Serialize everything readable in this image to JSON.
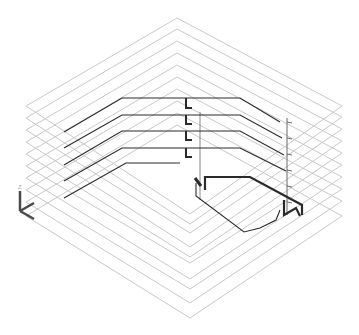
{
  "view": {
    "type": "isometric-3d-model",
    "background": "#ffffff",
    "plate_color": "#c8c8c8",
    "pipe_color": "#2a2a2a",
    "pipe_light_color": "#6a6a6a",
    "axis_color": "#4a4a4a"
  },
  "floor_plates": [
    {
      "top": [
        177,
        18
      ],
      "right": [
        342,
        106
      ],
      "bottom": [
        190,
        214
      ],
      "left": [
        26,
        106
      ]
    },
    {
      "top": [
        177,
        29
      ],
      "right": [
        342,
        117
      ],
      "bottom": [
        190,
        224
      ],
      "left": [
        26,
        118
      ]
    },
    {
      "top": [
        177,
        41
      ],
      "right": [
        342,
        129
      ],
      "bottom": [
        190,
        233
      ],
      "left": [
        26,
        130
      ]
    },
    {
      "top": [
        177,
        53
      ],
      "right": [
        342,
        141
      ],
      "bottom": [
        190,
        247
      ],
      "left": [
        26,
        142
      ]
    },
    {
      "top": [
        177,
        65
      ],
      "right": [
        342,
        153
      ],
      "bottom": [
        190,
        257
      ],
      "left": [
        26,
        154
      ]
    },
    {
      "top": [
        177,
        77
      ],
      "right": [
        342,
        165
      ],
      "bottom": [
        190,
        263
      ],
      "left": [
        26,
        166
      ]
    },
    {
      "top": [
        177,
        89
      ],
      "right": [
        342,
        177
      ],
      "bottom": [
        190,
        279
      ],
      "left": [
        26,
        178
      ]
    },
    {
      "top": [
        177,
        101
      ],
      "right": [
        342,
        189
      ],
      "bottom": [
        190,
        289
      ],
      "left": [
        26,
        190
      ]
    },
    {
      "top": [
        177,
        113
      ],
      "right": [
        342,
        201
      ],
      "bottom": [
        190,
        303
      ],
      "left": [
        26,
        202
      ]
    },
    {
      "top": [
        177,
        125
      ],
      "right": [
        342,
        216
      ],
      "bottom": [
        190,
        318
      ],
      "left": [
        26,
        216
      ]
    }
  ],
  "pipe_runs": [
    {
      "points": [
        [
          64,
          132
        ],
        [
          122,
          98
        ],
        [
          180,
          98
        ],
        [
          240,
          98
        ],
        [
          280,
          122
        ]
      ]
    },
    {
      "points": [
        [
          64,
          148
        ],
        [
          122,
          115
        ],
        [
          180,
          115
        ],
        [
          240,
          115
        ],
        [
          282,
          138
        ]
      ]
    },
    {
      "points": [
        [
          64,
          165
        ],
        [
          122,
          131
        ],
        [
          180,
          131
        ],
        [
          240,
          131
        ],
        [
          284,
          155
        ]
      ]
    },
    {
      "points": [
        [
          64,
          181
        ],
        [
          122,
          148
        ],
        [
          180,
          148
        ],
        [
          240,
          148
        ],
        [
          286,
          171
        ]
      ]
    },
    {
      "points": [
        [
          64,
          198
        ],
        [
          126,
          163
        ],
        [
          180,
          163
        ]
      ]
    }
  ],
  "risers": [
    {
      "points": [
        [
          186,
          98
        ],
        [
          186,
          108
        ],
        [
          192,
          108
        ]
      ]
    },
    {
      "points": [
        [
          186,
          115
        ],
        [
          186,
          124
        ],
        [
          192,
          124
        ]
      ]
    },
    {
      "points": [
        [
          186,
          131
        ],
        [
          186,
          140
        ],
        [
          192,
          140
        ]
      ]
    },
    {
      "points": [
        [
          186,
          148
        ],
        [
          186,
          157
        ],
        [
          192,
          157
        ]
      ]
    }
  ],
  "main_branch": {
    "points": [
      [
        205,
        190
      ],
      [
        205,
        177
      ],
      [
        250,
        177
      ],
      [
        302,
        205
      ],
      [
        302,
        215
      ]
    ]
  },
  "lower_branch": {
    "points": [
      [
        196,
        183
      ],
      [
        196,
        196
      ],
      [
        244,
        232
      ],
      [
        260,
        228
      ],
      [
        276,
        220
      ],
      [
        280,
        210
      ]
    ]
  },
  "right_vertical_line": {
    "x": 287,
    "y1": 118,
    "y2": 215
  },
  "center_vertical_line": {
    "x": 200,
    "y1": 112,
    "y2": 200
  },
  "axis_indicator": {
    "origin": [
      20,
      211
    ],
    "z_end": [
      20,
      191
    ],
    "x_end": [
      34,
      203
    ],
    "y_end": [
      34,
      219
    ],
    "label": "Z"
  }
}
